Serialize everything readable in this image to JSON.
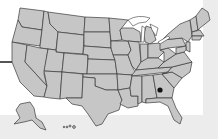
{
  "map": {
    "title": "United States map",
    "fill_color": "#c6c6c6",
    "border_color": "#3a3a3a",
    "background_color": "#ffffff",
    "band_color": "#ececec",
    "marker": {
      "label": "Location marker",
      "state": "Georgia",
      "x": 160,
      "y": 90,
      "color": "#111111"
    },
    "insets": [
      "Alaska",
      "Hawaii"
    ]
  }
}
